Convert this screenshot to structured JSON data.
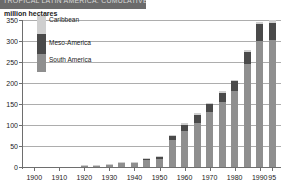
{
  "title_bar": {
    "text": "TROPICAL LATIN AMERICA: CUMULATIVE DEFORESTATION"
  },
  "axis_label": {
    "y_unit": "million hectares"
  },
  "legend": {
    "items": [
      {
        "label": "Caribbean",
        "color": "#cfcfcf"
      },
      {
        "label": "Meso-America",
        "color": "#4a4a4a"
      },
      {
        "label": "South America",
        "color": "#8f8f8f"
      }
    ]
  },
  "chart_data": {
    "type": "bar",
    "stacked": true,
    "title": "TROPICAL LATIN AMERICA: CUMULATIVE DEFORESTATION",
    "xlabel": "",
    "ylabel": "million hectares",
    "ylim": [
      0,
      350
    ],
    "yticks": [
      0,
      50,
      100,
      150,
      200,
      250,
      300,
      350
    ],
    "grid": true,
    "legend_position": "inside-top-left",
    "x_tick_labels": [
      "1900",
      "1910",
      "1920",
      "1930",
      "1940",
      "1950",
      "1960",
      "1970",
      "1980",
      "1990",
      "95"
    ],
    "categories": [
      "1900",
      "1905",
      "1910",
      "1915",
      "1920",
      "1925",
      "1930",
      "1935",
      "1940",
      "1945",
      "1950",
      "1955",
      "1960",
      "1965",
      "1970",
      "1975",
      "1980",
      "1985",
      "1990",
      "1995"
    ],
    "series": [
      {
        "name": "South America",
        "color": "#8f8f8f",
        "values": [
          0,
          0,
          0,
          0,
          1,
          1.5,
          4,
          9,
          9,
          17,
          20,
          65,
          85,
          105,
          130,
          155,
          180,
          245,
          300,
          302
        ]
      },
      {
        "name": "Meso-America",
        "color": "#4a4a4a",
        "values": [
          0,
          0,
          0,
          0,
          0.3,
          0.5,
          1,
          1.5,
          1.5,
          3,
          4,
          10,
          16,
          20,
          20,
          22,
          24,
          28,
          40,
          42
        ]
      },
      {
        "name": "Caribbean",
        "color": "#cfcfcf",
        "values": [
          0,
          0,
          0,
          0,
          0.2,
          0.2,
          0.5,
          0.5,
          0.5,
          1,
          1,
          2,
          3,
          3,
          3,
          3,
          3,
          5,
          5,
          6
        ]
      }
    ],
    "totals": [
      0,
      0,
      0,
      0,
      1.5,
      2.2,
      5.5,
      11,
      11,
      21,
      25,
      77,
      104,
      128,
      153,
      180,
      207,
      278,
      345,
      350
    ]
  }
}
